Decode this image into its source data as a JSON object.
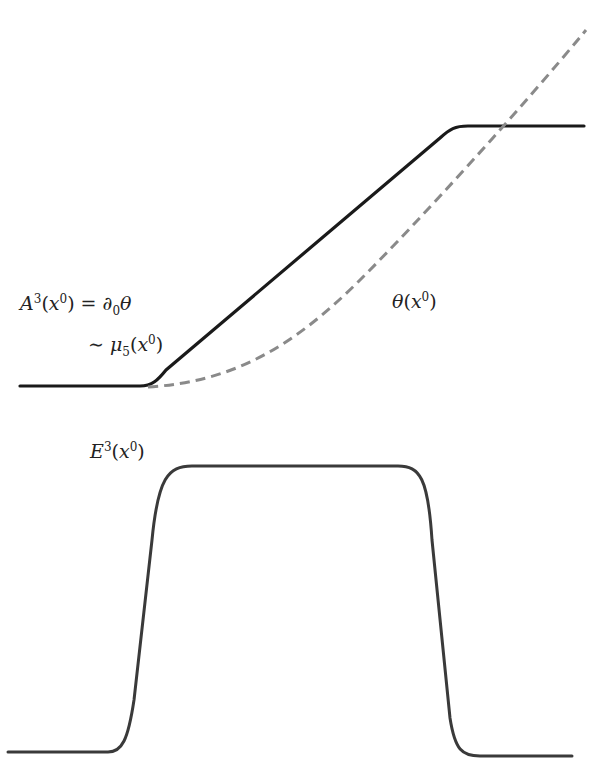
{
  "labels": {
    "a3": {
      "base": "A",
      "sup": "3",
      "open": "(",
      "x": "x",
      "xsup": "0",
      "close": ")",
      "eq": " = ",
      "d": "∂",
      "dsub": "0",
      "theta": "θ"
    },
    "mu5": {
      "tilde": "∼ ",
      "mu": "μ",
      "sub": "5",
      "open": "(",
      "x": "x",
      "xsup": "0",
      "close": ")"
    },
    "theta": {
      "theta": "θ",
      "open": "(",
      "x": "x",
      "xsup": "0",
      "close": ")"
    },
    "e3": {
      "base": "E",
      "sup": "3",
      "open": "(",
      "x": "x",
      "xsup": "0",
      "close": ")"
    }
  },
  "colors": {
    "solid": "#1a1a1a",
    "dashed": "#8a8a8a",
    "lower": "#3a3a3a",
    "background": "#ffffff"
  },
  "curves": {
    "a3_solid": "M20,386 L140,386 C152,386 158,380 166,370 L440,138 C450,129 455,126 468,126 L584,126",
    "theta_dashed": "M148,387 C230,382 290,350 360,280 C420,220 520,110 586,30",
    "e3_lower": "M8,752 L108,752 C122,752 128,740 134,700 L152,540 C158,478 168,466 192,466 L398,466 C420,466 428,478 432,540 L450,718 C455,750 462,756 480,756 L572,756"
  }
}
